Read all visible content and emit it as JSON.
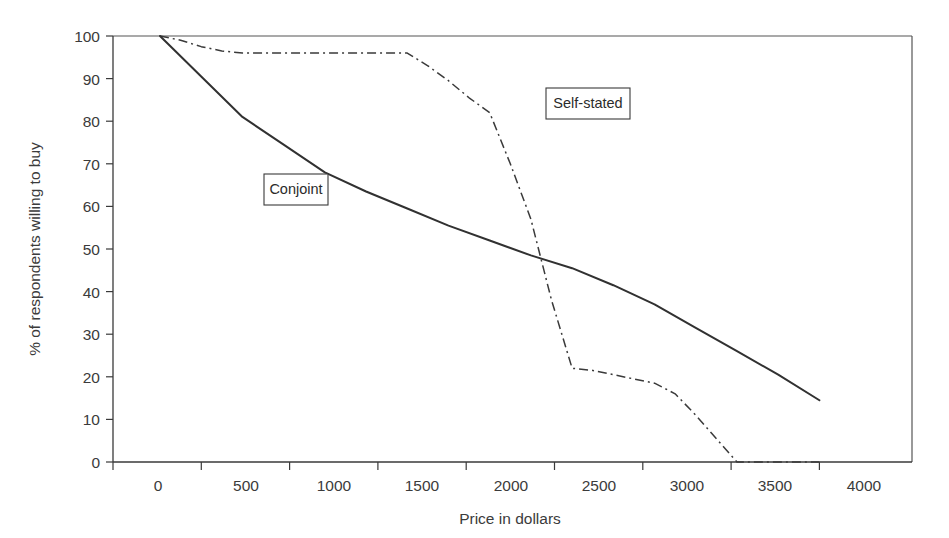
{
  "chart_data": {
    "type": "line",
    "title": "",
    "xlabel": "Price in dollars",
    "ylabel": "% of respondents willing to buy",
    "xlim": [
      -250,
      4250
    ],
    "ylim": [
      0,
      100
    ],
    "xticks": [
      0,
      500,
      1000,
      1500,
      2000,
      2500,
      3000,
      3500,
      4000
    ],
    "xticklabels": [
      "0",
      "500",
      "1000",
      "1500",
      "2000",
      "2500",
      "3000",
      "3500",
      "4000"
    ],
    "yticks": [
      0,
      10,
      20,
      30,
      40,
      50,
      60,
      70,
      80,
      90,
      100
    ],
    "yticklabels": [
      "0",
      "10",
      "20",
      "30",
      "40",
      "50",
      "60",
      "70",
      "80",
      "90",
      "100"
    ],
    "grid": false,
    "legend": "inline-callout-boxes",
    "series": [
      {
        "name": "Conjoint",
        "style": "solid",
        "color": "#313131",
        "x": [
          0,
          250,
          500,
          750,
          1000,
          1250,
          1500,
          1750,
          2000,
          2250,
          2500,
          2750,
          3000,
          3250,
          3500,
          3750,
          4000
        ],
        "values": [
          100,
          90.5,
          81,
          74.5,
          68,
          63.5,
          59.5,
          55.5,
          52,
          48.5,
          45.5,
          41.5,
          37,
          31.5,
          26,
          20.5,
          14.5
        ]
      },
      {
        "name": "Self-stated",
        "style": "dash-dot",
        "color": "#3a3a3a",
        "x": [
          0,
          125,
          250,
          375,
          500,
          750,
          1000,
          1250,
          1500,
          1625,
          1750,
          1875,
          2000,
          2125,
          2250,
          2375,
          2500,
          2625,
          2750,
          3000,
          3125,
          3250,
          3500,
          3750,
          4000
        ],
        "values": [
          100,
          99,
          97.5,
          96.5,
          96,
          96,
          96,
          96,
          96,
          93,
          89.5,
          85.5,
          82,
          70,
          57,
          38,
          22,
          21.5,
          20.5,
          18.5,
          16,
          11,
          0,
          0,
          0
        ]
      }
    ],
    "annotations": [
      {
        "text": "Conjoint",
        "series": "Conjoint",
        "boxed": true
      },
      {
        "text": "Self-stated",
        "series": "Self-stated",
        "boxed": true
      }
    ]
  },
  "figure": {
    "background_color": "#ffffff",
    "axis_color": "#3a3a3a",
    "text_color": "#3b3b3b"
  }
}
